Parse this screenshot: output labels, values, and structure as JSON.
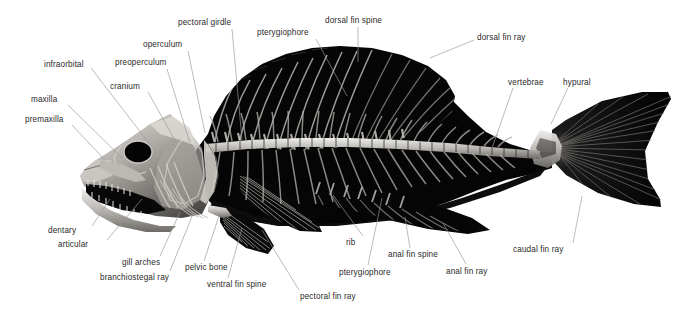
{
  "figure": {
    "background_color": "#ffffff",
    "label_color": "#2b2b2b",
    "leader_line_color": "#9a9a9a",
    "specimen_colors": {
      "bone_light": "#d8d6d2",
      "bone_mid": "#8e8c88",
      "fin_dark": "#0a0a0a",
      "body_black": "#000000"
    }
  },
  "labels": [
    {
      "id": "pectoral-girdle",
      "text": "pectoral girdle",
      "x": 178,
      "y": 18,
      "lx": 232,
      "ly": 29,
      "tx": 242,
      "ty": 140
    },
    {
      "id": "pterygiophore-top",
      "text": "pterygiophore",
      "x": 257,
      "y": 28,
      "lx": 316,
      "ly": 39,
      "tx": 347,
      "ty": 96
    },
    {
      "id": "dorsal-fin-spine",
      "text": "dorsal fin spine",
      "x": 325,
      "y": 16,
      "lx": 358,
      "ly": 27,
      "tx": 358,
      "ty": 62
    },
    {
      "id": "dorsal-fin-ray",
      "text": "dorsal fin ray",
      "x": 477,
      "y": 33,
      "lx": 474,
      "ly": 40,
      "tx": 430,
      "ty": 58
    },
    {
      "id": "operculum",
      "text": "operculum",
      "x": 143,
      "y": 40,
      "lx": 188,
      "ly": 51,
      "tx": 205,
      "ty": 133
    },
    {
      "id": "infraorbital",
      "text": "infraorbital",
      "x": 44,
      "y": 60,
      "lx": 91,
      "ly": 68,
      "tx": 152,
      "ty": 147
    },
    {
      "id": "preoperculum",
      "text": "preoperculum",
      "x": 115,
      "y": 58,
      "lx": 167,
      "ly": 69,
      "tx": 190,
      "ty": 143
    },
    {
      "id": "vertebrae",
      "text": "vertebrae",
      "x": 508,
      "y": 78,
      "lx": 513,
      "ly": 88,
      "tx": 492,
      "ty": 148
    },
    {
      "id": "hypural",
      "text": "hypural",
      "x": 563,
      "y": 78,
      "lx": 568,
      "ly": 88,
      "tx": 551,
      "ty": 124
    },
    {
      "id": "cranium",
      "text": "cranium",
      "x": 110,
      "y": 82,
      "lx": 148,
      "ly": 92,
      "tx": 176,
      "ty": 142
    },
    {
      "id": "maxilla",
      "text": "maxilla",
      "x": 31,
      "y": 95,
      "lx": 68,
      "ly": 105,
      "tx": 122,
      "ty": 158
    },
    {
      "id": "premaxilla",
      "text": "premaxilla",
      "x": 25,
      "y": 115,
      "lx": 72,
      "ly": 125,
      "tx": 105,
      "ty": 160
    },
    {
      "id": "dentary",
      "text": "dentary",
      "x": 48,
      "y": 226,
      "lx": 92,
      "ly": 226,
      "tx": 110,
      "ty": 199
    },
    {
      "id": "articular",
      "text": "articular",
      "x": 58,
      "y": 240,
      "lx": 107,
      "ly": 240,
      "tx": 142,
      "ty": 199
    },
    {
      "id": "rib",
      "text": "rib",
      "x": 346,
      "y": 238,
      "lx": 363,
      "ly": 236,
      "tx": 333,
      "ty": 195
    },
    {
      "id": "anal-fin-spine",
      "text": "anal fin spine",
      "x": 388,
      "y": 250,
      "lx": 410,
      "ly": 248,
      "tx": 405,
      "ty": 217
    },
    {
      "id": "gill-arches",
      "text": "gill arches",
      "x": 122,
      "y": 258,
      "lx": 160,
      "ly": 256,
      "tx": 180,
      "ty": 212
    },
    {
      "id": "pelvic-bone",
      "text": "pelvic bone",
      "x": 185,
      "y": 263,
      "lx": 204,
      "ly": 261,
      "tx": 219,
      "ty": 216
    },
    {
      "id": "anal-fin-ray",
      "text": "anal fin ray",
      "x": 446,
      "y": 267,
      "lx": 466,
      "ly": 264,
      "tx": 443,
      "ty": 223
    },
    {
      "id": "pterygiophore-bot",
      "text": "pterygiophore",
      "x": 339,
      "y": 268,
      "lx": 368,
      "ly": 265,
      "tx": 382,
      "ty": 198
    },
    {
      "id": "branchiostegal-ray",
      "text": "branchiostegal ray",
      "x": 100,
      "y": 273,
      "lx": 170,
      "ly": 271,
      "tx": 193,
      "ty": 214
    },
    {
      "id": "ventral-fin-spine",
      "text": "ventral fin spine",
      "x": 207,
      "y": 280,
      "lx": 228,
      "ly": 278,
      "tx": 242,
      "ty": 228
    },
    {
      "id": "caudal-fin-ray",
      "text": "caudal fin ray",
      "x": 513,
      "y": 245,
      "lx": 573,
      "ly": 243,
      "tx": 582,
      "ty": 196
    },
    {
      "id": "pectoral-fin-ray",
      "text": "pectoral fin ray",
      "x": 300,
      "y": 292,
      "lx": 299,
      "ly": 290,
      "tx": 262,
      "ty": 230
    }
  ]
}
